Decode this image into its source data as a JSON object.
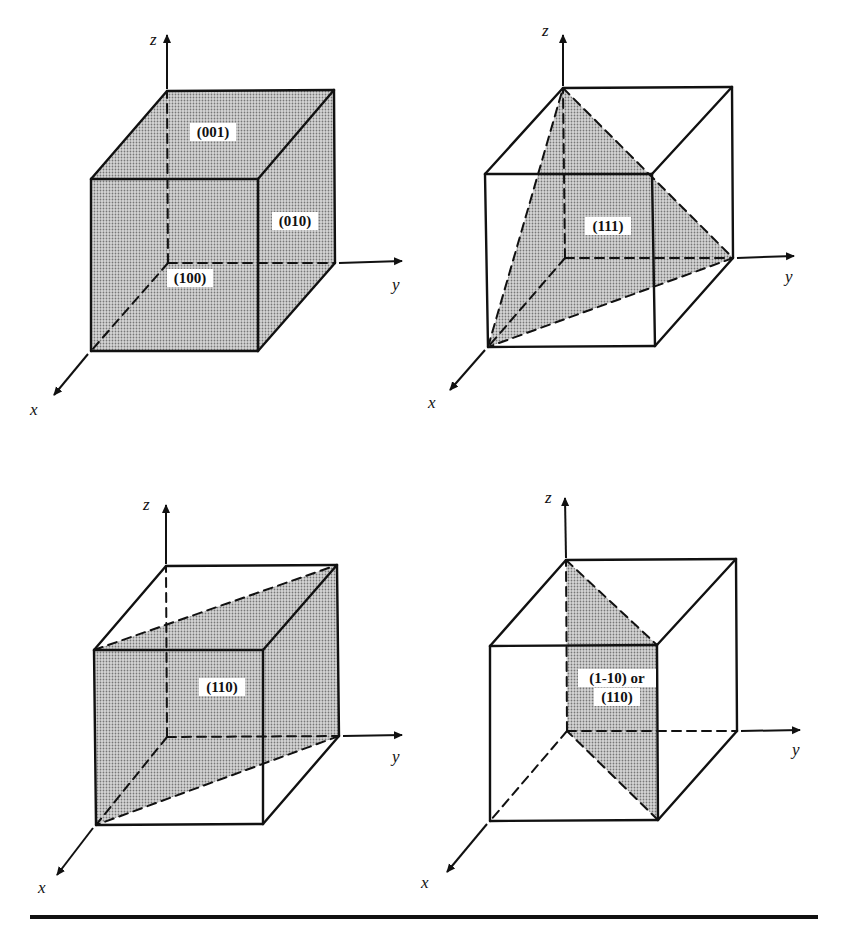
{
  "figure": {
    "colors": {
      "ink": "#111111",
      "shade": "#bdbdbd",
      "background": "#ffffff"
    },
    "panels": [
      {
        "id": "panel-100-010-001",
        "cube": {
          "o": [
            168,
            263
          ],
          "y": [
            335,
            263
          ],
          "x": [
            91,
            351
          ],
          "xy": [
            258,
            351
          ],
          "z": [
            167,
            91
          ],
          "yz": [
            334,
            90
          ],
          "xz": [
            91,
            179
          ],
          "xyz": [
            258,
            179
          ]
        },
        "axes": {
          "z_tip": [
            167,
            35
          ],
          "y_tip": [
            402,
            261
          ],
          "x_tip": [
            54,
            395
          ]
        },
        "axis_labels": {
          "z": "z",
          "y": "y",
          "x": "x"
        },
        "axis_label_pos": {
          "z": [
            150,
            45
          ],
          "y": [
            392,
            290
          ],
          "x": [
            30,
            415
          ]
        },
        "planes": [
          {
            "name": "plane-001",
            "points": [
              "z",
              "yz",
              "xyz",
              "xz"
            ]
          },
          {
            "name": "plane-010",
            "points": [
              "y",
              "yz",
              "xyz",
              "xy"
            ]
          },
          {
            "name": "plane-100",
            "points": [
              "x",
              "xy",
              "xyz",
              "xz"
            ]
          }
        ],
        "labels": [
          {
            "text": "(001)",
            "pos": [
              213,
              135
            ]
          },
          {
            "text": "(010)",
            "pos": [
              295,
              224
            ]
          },
          {
            "text": "(100)",
            "pos": [
              190,
              281
            ]
          }
        ]
      },
      {
        "id": "panel-111",
        "cube": {
          "o": [
            565,
            258
          ],
          "y": [
            733,
            258
          ],
          "x": [
            488,
            347
          ],
          "xy": [
            655,
            346
          ],
          "z": [
            563,
            88
          ],
          "yz": [
            732,
            87
          ],
          "xz": [
            485,
            174
          ],
          "xyz": [
            652,
            174
          ]
        },
        "axes": {
          "z_tip": [
            563,
            35
          ],
          "y_tip": [
            794,
            256
          ],
          "x_tip": [
            450,
            390
          ]
        },
        "axis_labels": {
          "z": "z",
          "y": "y",
          "x": "x"
        },
        "axis_label_pos": {
          "z": [
            542,
            36
          ],
          "y": [
            785,
            282
          ],
          "x": [
            428,
            408
          ]
        },
        "planes": [
          {
            "name": "plane-111",
            "points": [
              "z",
              "y",
              "x"
            ]
          }
        ],
        "labels": [
          {
            "text": "(111)",
            "pos": [
              608,
              229
            ]
          }
        ]
      },
      {
        "id": "panel-110",
        "cube": {
          "o": [
            167,
            737
          ],
          "y": [
            339,
            736
          ],
          "x": [
            96,
            825
          ],
          "xy": [
            263,
            824
          ],
          "z": [
            166,
            566
          ],
          "yz": [
            337,
            565
          ],
          "xz": [
            94,
            650
          ],
          "xyz": [
            263,
            650
          ]
        },
        "axes": {
          "z_tip": [
            166,
            505
          ],
          "y_tip": [
            402,
            735
          ],
          "x_tip": [
            57,
            875
          ]
        },
        "axis_labels": {
          "z": "z",
          "y": "y",
          "x": "x"
        },
        "axis_label_pos": {
          "z": [
            143,
            510
          ],
          "y": [
            392,
            762
          ],
          "x": [
            38,
            893
          ]
        },
        "planes": [
          {
            "name": "plane-110",
            "points": [
              "xz",
              "yz",
              "y",
              "x"
            ]
          }
        ],
        "labels": [
          {
            "text": "(110)",
            "pos": [
              222,
              690
            ]
          }
        ]
      },
      {
        "id": "panel-1-10",
        "cube": {
          "o": [
            567,
            731
          ],
          "y": [
            737,
            731
          ],
          "x": [
            490,
            821
          ],
          "xy": [
            658,
            820
          ],
          "z": [
            566,
            560
          ],
          "yz": [
            736,
            559
          ],
          "xz": [
            490,
            646
          ],
          "xyz": [
            657,
            645
          ]
        },
        "axes": {
          "z_tip": [
            565,
            498
          ],
          "y_tip": [
            800,
            730
          ],
          "x_tip": [
            447,
            872
          ]
        },
        "axis_labels": {
          "z": "z",
          "y": "y",
          "x": "x"
        },
        "axis_label_pos": {
          "z": [
            545,
            503
          ],
          "y": [
            792,
            755
          ],
          "x": [
            421,
            888
          ]
        },
        "planes": [
          {
            "name": "plane-1-10",
            "points": [
              "z",
              "xyz",
              "xy",
              "o"
            ]
          }
        ],
        "labels": [
          {
            "text": "(1-10) or",
            "pos": [
              617,
              681
            ]
          },
          {
            "text": "(110)",
            "pos": [
              617,
              700
            ]
          }
        ]
      }
    ]
  }
}
